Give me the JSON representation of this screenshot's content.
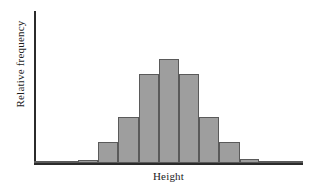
{
  "chart_data": {
    "type": "bar",
    "title": "",
    "subtitle": "",
    "xlabel": "Height",
    "ylabel": "Relative frequency",
    "grid": false,
    "legend": null,
    "legend_position": "none",
    "axis_color": "#2b2b2b",
    "bar_fill_color": "#9e9e9e",
    "bar_edge_color": "#5a5a5a",
    "background_color": "#ffffff",
    "xlim": [
      0,
      11
    ],
    "ylim": [
      0,
      1
    ],
    "x_tick_labels": [],
    "y_tick_labels": [],
    "annotations": [],
    "categories": [
      "bin-1",
      "bin-2",
      "bin-3",
      "bin-4",
      "bin-5",
      "bin-6",
      "bin-7",
      "bin-8",
      "bin-9",
      "bin-10",
      "bin-11"
    ],
    "values": [
      0.005,
      0.01,
      0.14,
      0.3,
      0.58,
      0.68,
      0.58,
      0.3,
      0.14,
      0.015,
      0.005
    ],
    "bars": [
      {
        "name": "bin-1",
        "left_pct": 0.0,
        "width_pct": 16.4,
        "height_pct": 0.9
      },
      {
        "name": "bin-2",
        "left_pct": 16.4,
        "width_pct": 7.4,
        "height_pct": 2.0
      },
      {
        "name": "bin-3",
        "left_pct": 23.8,
        "width_pct": 7.4,
        "height_pct": 13.8
      },
      {
        "name": "bin-4",
        "left_pct": 31.2,
        "width_pct": 7.8,
        "height_pct": 30.3
      },
      {
        "name": "bin-5",
        "left_pct": 39.0,
        "width_pct": 7.4,
        "height_pct": 58.6
      },
      {
        "name": "bin-6",
        "left_pct": 46.4,
        "width_pct": 7.4,
        "height_pct": 68.4
      },
      {
        "name": "bin-7",
        "left_pct": 53.8,
        "width_pct": 7.4,
        "height_pct": 58.6
      },
      {
        "name": "bin-8",
        "left_pct": 61.2,
        "width_pct": 7.4,
        "height_pct": 30.3
      },
      {
        "name": "bin-9",
        "left_pct": 68.6,
        "width_pct": 7.8,
        "height_pct": 13.8
      },
      {
        "name": "bin-10",
        "left_pct": 76.4,
        "width_pct": 7.4,
        "height_pct": 2.6
      },
      {
        "name": "bin-11",
        "left_pct": 83.8,
        "width_pct": 16.2,
        "height_pct": 0.9
      }
    ]
  },
  "labels": {
    "x_axis": "Height",
    "y_axis": "Relative frequency"
  }
}
